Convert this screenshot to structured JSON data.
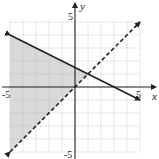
{
  "chart_data": {
    "type": "line",
    "title": "",
    "xlabel": "x",
    "ylabel": "y",
    "xlim": [
      -5,
      5
    ],
    "ylim": [
      -5,
      5
    ],
    "grid": true,
    "tick_labels": {
      "x_min": "-5",
      "x_max": "5",
      "y_min": "-5",
      "y_max": "5"
    },
    "series": [
      {
        "name": "boundary-solid",
        "style": "solid",
        "equation": "y = -x/2 + 3/2",
        "x": [
          -5,
          5
        ],
        "y": [
          4,
          -1
        ],
        "arrows": "both"
      },
      {
        "name": "boundary-dashed",
        "style": "dashed",
        "equation": "y = x",
        "x": [
          -5,
          5
        ],
        "y": [
          -5,
          5
        ],
        "arrows": "both"
      }
    ],
    "shaded_region": {
      "description": "y > x and y <= -x/2 + 3/2",
      "vertices": [
        [
          -5,
          -5
        ],
        [
          -5,
          4
        ],
        [
          1,
          1
        ]
      ],
      "color": "#d9d9d9"
    },
    "intersection": [
      1,
      1
    ]
  }
}
